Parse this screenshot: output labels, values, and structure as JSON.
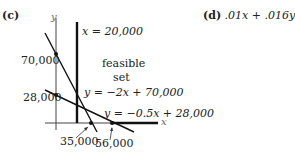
{
  "parts": {
    "c_label": "(c)",
    "d_label": "(d)",
    "d_expression": ".01x + .016y"
  },
  "graph": {
    "axis_x_label": "x",
    "axis_y_label": "y",
    "vertical_line_label": "x = 20,000",
    "region_label_line1": "feasible",
    "region_label_line2": "set",
    "line1_label": "y = −2x + 70,000",
    "line2_label": "y = −0.5x + 28,000",
    "y_ticks": [
      "70,000",
      "28,000"
    ],
    "x_ticks": [
      "35,000",
      "56,000"
    ]
  },
  "colors": {
    "ink": "#222222",
    "background": "#ffffff"
  }
}
